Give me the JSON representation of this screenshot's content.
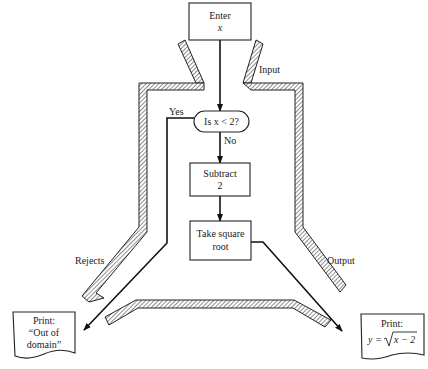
{
  "diagram": {
    "nodes": {
      "enter": {
        "line1": "Enter",
        "line2": "x"
      },
      "decision": {
        "label": "Is x < 2?"
      },
      "subtract": {
        "line1": "Subtract",
        "line2": "2"
      },
      "sqrt": {
        "line1": "Take square",
        "line2": "root"
      },
      "reject_output": {
        "line1": "Print:",
        "line2": "“Out of",
        "line3": "domain”"
      },
      "result_output": {
        "line1": "Print:",
        "line2_prefix": "y =",
        "line2_radicand": "x − 2"
      }
    },
    "edge_labels": {
      "yes": "Yes",
      "no": "No"
    },
    "machine_labels": {
      "input": "Input",
      "rejects": "Rejects",
      "output": "Output"
    }
  }
}
